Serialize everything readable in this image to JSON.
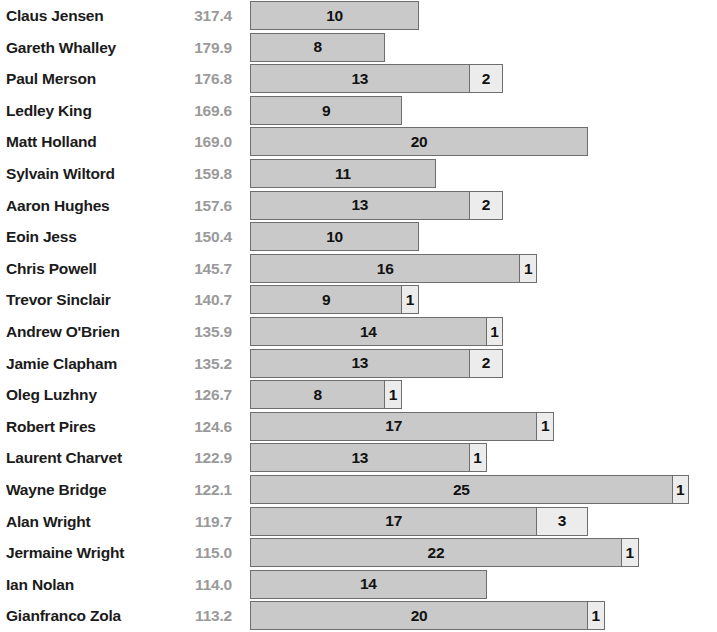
{
  "chart_data": {
    "type": "bar",
    "title": "",
    "subtitle": "",
    "xlabel": "",
    "ylabel": "",
    "orientation": "horizontal",
    "stacked": true,
    "grid": false,
    "legend": "none",
    "x_axis_origin_px": 250,
    "px_per_unit": 16.9,
    "colors": {
      "primary_segment": "#c9c9c9",
      "secondary_segment": "#ececec",
      "segment_border": "#6e6e6e",
      "name_text": "#1b1b1b",
      "value_text": "#9a9a9a",
      "segment_label_text": "#111111",
      "background": "#ffffff"
    },
    "columns": [
      "name",
      "value",
      "segment_1",
      "segment_2"
    ],
    "categories": [
      "Claus Jensen",
      "Gareth Whalley",
      "Paul Merson",
      "Ledley King",
      "Matt Holland",
      "Sylvain Wiltord",
      "Aaron Hughes",
      "Eoin Jess",
      "Chris Powell",
      "Trevor Sinclair",
      "Andrew O'Brien",
      "Jamie Clapham",
      "Oleg Luzhny",
      "Robert Pires",
      "Laurent Charvet",
      "Wayne Bridge",
      "Alan Wright",
      "Jermaine Wright",
      "Ian Nolan",
      "Gianfranco Zola"
    ],
    "values": [
      317.4,
      179.9,
      176.8,
      169.6,
      169.0,
      159.8,
      157.6,
      150.4,
      145.7,
      140.7,
      135.9,
      135.2,
      126.7,
      124.6,
      122.9,
      122.1,
      119.7,
      115.0,
      114.0,
      113.2
    ],
    "series": [
      {
        "name": "segment_1",
        "values": [
          10,
          8,
          13,
          9,
          20,
          11,
          13,
          10,
          16,
          9,
          14,
          13,
          8,
          17,
          13,
          25,
          17,
          22,
          14,
          20
        ]
      },
      {
        "name": "segment_2",
        "values": [
          0,
          0,
          2,
          0,
          0,
          0,
          2,
          0,
          1,
          1,
          1,
          2,
          1,
          1,
          1,
          1,
          3,
          1,
          0,
          1
        ]
      }
    ],
    "rows": [
      {
        "name": "Claus Jensen",
        "value": "317.4",
        "seg1": 10,
        "seg1_label": "10",
        "seg2": 0,
        "seg2_label": ""
      },
      {
        "name": "Gareth Whalley",
        "value": "179.9",
        "seg1": 8,
        "seg1_label": "8",
        "seg2": 0,
        "seg2_label": ""
      },
      {
        "name": "Paul Merson",
        "value": "176.8",
        "seg1": 13,
        "seg1_label": "13",
        "seg2": 2,
        "seg2_label": "2"
      },
      {
        "name": "Ledley King",
        "value": "169.6",
        "seg1": 9,
        "seg1_label": "9",
        "seg2": 0,
        "seg2_label": ""
      },
      {
        "name": "Matt Holland",
        "value": "169.0",
        "seg1": 20,
        "seg1_label": "20",
        "seg2": 0,
        "seg2_label": ""
      },
      {
        "name": "Sylvain Wiltord",
        "value": "159.8",
        "seg1": 11,
        "seg1_label": "11",
        "seg2": 0,
        "seg2_label": ""
      },
      {
        "name": "Aaron Hughes",
        "value": "157.6",
        "seg1": 13,
        "seg1_label": "13",
        "seg2": 2,
        "seg2_label": "2"
      },
      {
        "name": "Eoin Jess",
        "value": "150.4",
        "seg1": 10,
        "seg1_label": "10",
        "seg2": 0,
        "seg2_label": ""
      },
      {
        "name": "Chris Powell",
        "value": "145.7",
        "seg1": 16,
        "seg1_label": "16",
        "seg2": 1,
        "seg2_label": "1"
      },
      {
        "name": "Trevor Sinclair",
        "value": "140.7",
        "seg1": 9,
        "seg1_label": "9",
        "seg2": 1,
        "seg2_label": "1"
      },
      {
        "name": "Andrew O'Brien",
        "value": "135.9",
        "seg1": 14,
        "seg1_label": "14",
        "seg2": 1,
        "seg2_label": "1"
      },
      {
        "name": "Jamie Clapham",
        "value": "135.2",
        "seg1": 13,
        "seg1_label": "13",
        "seg2": 2,
        "seg2_label": "2"
      },
      {
        "name": "Oleg Luzhny",
        "value": "126.7",
        "seg1": 8,
        "seg1_label": "8",
        "seg2": 1,
        "seg2_label": "1"
      },
      {
        "name": "Robert Pires",
        "value": "124.6",
        "seg1": 17,
        "seg1_label": "17",
        "seg2": 1,
        "seg2_label": "1"
      },
      {
        "name": "Laurent Charvet",
        "value": "122.9",
        "seg1": 13,
        "seg1_label": "13",
        "seg2": 1,
        "seg2_label": "1"
      },
      {
        "name": "Wayne Bridge",
        "value": "122.1",
        "seg1": 25,
        "seg1_label": "25",
        "seg2": 1,
        "seg2_label": "1"
      },
      {
        "name": "Alan Wright",
        "value": "119.7",
        "seg1": 17,
        "seg1_label": "17",
        "seg2": 3,
        "seg2_label": "3"
      },
      {
        "name": "Jermaine Wright",
        "value": "115.0",
        "seg1": 22,
        "seg1_label": "22",
        "seg2": 1,
        "seg2_label": "1"
      },
      {
        "name": "Ian Nolan",
        "value": "114.0",
        "seg1": 14,
        "seg1_label": "14",
        "seg2": 0,
        "seg2_label": ""
      },
      {
        "name": "Gianfranco Zola",
        "value": "113.2",
        "seg1": 20,
        "seg1_label": "20",
        "seg2": 1,
        "seg2_label": "1"
      }
    ]
  }
}
